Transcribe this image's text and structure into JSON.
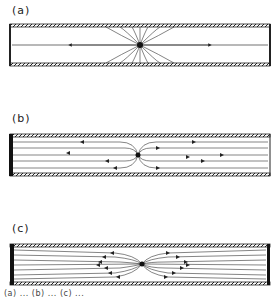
{
  "figure": {
    "panels": [
      {
        "id": "a",
        "label": "(a)",
        "description": "Point source in channel with open ends; streamlines radiate to walls, axial flow both directions"
      },
      {
        "id": "b",
        "label": "(b)",
        "description": "Point source in channel with one closed (left) wall; parallel streamlines from source along channel"
      },
      {
        "id": "c",
        "label": "(c)",
        "description": "Point source in channel with both walls permeable; streamlines fan out between hatched walls"
      }
    ],
    "caption_fragment": "(a) ... (b) ... (c) ..."
  }
}
